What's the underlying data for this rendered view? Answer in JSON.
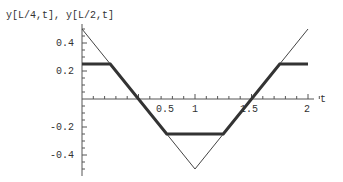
{
  "chart_data": {
    "type": "line",
    "title": "",
    "ylabel": "y[L/4,t], y[L/2,t]",
    "xlabel": "t",
    "xlim": [
      0,
      2.1
    ],
    "ylim": [
      -0.5,
      0.5
    ],
    "x_ticks": [
      "0.5",
      "1",
      "1.5",
      "2"
    ],
    "y_ticks": [
      "0.4",
      "0.2",
      "-0.2",
      "-0.4"
    ],
    "grid": false,
    "series": [
      {
        "name": "y[L/2,t]",
        "style": "thin",
        "x": [
          0,
          1,
          2
        ],
        "y": [
          0.5,
          -0.5,
          0.5
        ]
      },
      {
        "name": "y[L/4,t]",
        "style": "thick",
        "x": [
          0,
          0.25,
          0.75,
          1.25,
          1.75,
          2
        ],
        "y": [
          0.25,
          0.25,
          -0.25,
          -0.25,
          0.25,
          0.25
        ]
      }
    ]
  }
}
